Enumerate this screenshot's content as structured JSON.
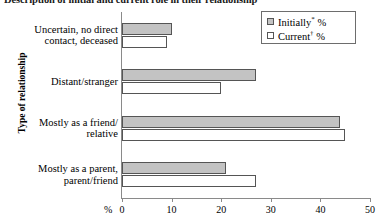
{
  "chart_data": {
    "type": "bar",
    "orientation": "horizontal",
    "title": "Description of initial and current role in their relationship",
    "xlabel": "%",
    "ylabel": "Type of relationship",
    "xlim": [
      0,
      50
    ],
    "xticks": [
      0,
      10,
      20,
      30,
      40,
      50
    ],
    "xtick_labels": [
      "0",
      "10",
      "20",
      "30",
      "40",
      "50"
    ],
    "grid": false,
    "legend_position": "top-right",
    "categories": [
      "Uncertain, no direct\ncontact, deceased",
      "Distant/stranger",
      "Mostly as a friend/\nrelative",
      "Mostly as a parent,\nparent/friend"
    ],
    "series": [
      {
        "name": "Initially* %",
        "key": "initially",
        "color": "#c3c3c3",
        "values": [
          10,
          27,
          44,
          21
        ]
      },
      {
        "name": "Current† %",
        "key": "current",
        "color": "#ffffff",
        "values": [
          9,
          20,
          45,
          27
        ]
      }
    ],
    "legend_entries": [
      {
        "label": "Initially",
        "marker": "*",
        "suffix": " %",
        "swatch": "initially"
      },
      {
        "label": "Current",
        "marker": "†",
        "suffix": " %",
        "swatch": "current"
      }
    ]
  }
}
